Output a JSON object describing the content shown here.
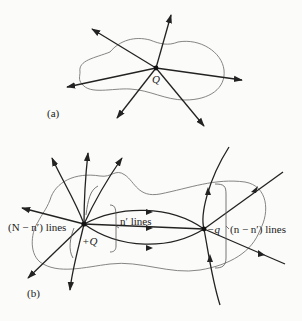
{
  "figure": {
    "panel_a": {
      "label": "(a)",
      "charge_label": "Q",
      "description": "Closed surface enclosing point charge Q with field lines radiating outward"
    },
    "panel_b": {
      "label": "(b)",
      "positive_charge_label": "+Q",
      "negative_charge_label": "−q",
      "bracket_left": "(N − n′) lines",
      "bracket_middle": "n′ lines",
      "bracket_right": "(n − n′) lines",
      "description": "Closed surface enclosing +Q and −q; n′ lines run from +Q to −q"
    },
    "colors": {
      "line": "#222222",
      "boundary": "#777777",
      "background": "#fbfbf9"
    }
  }
}
